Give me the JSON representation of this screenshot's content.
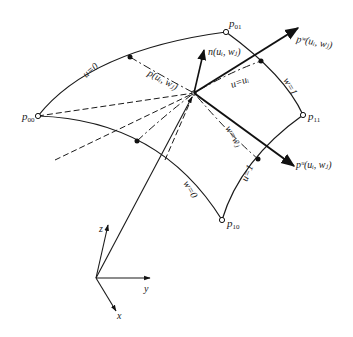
{
  "diagram": {
    "type": "parametric-surface-patch",
    "corners": {
      "p00": {
        "label": "p",
        "sub": "00"
      },
      "p01": {
        "label": "p",
        "sub": "01"
      },
      "p10": {
        "label": "p",
        "sub": "10"
      },
      "p11": {
        "label": "p",
        "sub": "11"
      }
    },
    "point_label": "p(uᵢ, wⱼ)",
    "normal_label": "n(uᵢ, wⱼ)",
    "tangent_w_label": "pʷ(uᵢ, wⱼ)",
    "tangent_u_label": "pᵘ(uᵢ, wⱼ)",
    "iso_labels": {
      "u0": "u=0",
      "u1": "u=1",
      "w0": "w=0",
      "w1": "w=1",
      "u_i": "u=uᵢ",
      "w_j": "w=wⱼ"
    },
    "axes": {
      "x": "x",
      "y": "y",
      "z": "z"
    }
  }
}
